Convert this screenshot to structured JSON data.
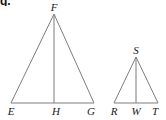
{
  "figure": {
    "corner_tag": "g.",
    "background_color": "#ffffff",
    "stroke_color": "#7d7d7d",
    "label_color": "#1b1b1b",
    "stroke_width": 1,
    "width": 166,
    "height": 120,
    "triangles": [
      {
        "name": "triangle-efg",
        "vertices": {
          "apex": {
            "label": "F",
            "x": 54,
            "y": 14
          },
          "base_left": {
            "label": "E",
            "x": 11,
            "y": 103
          },
          "base_right": {
            "label": "G",
            "x": 94,
            "y": 103
          }
        },
        "altitude_foot": {
          "label": "H",
          "x": 54,
          "y": 103
        },
        "label_positions": {
          "F": {
            "x": 54,
            "y": 2
          },
          "E": {
            "x": 11,
            "y": 106
          },
          "H": {
            "x": 56,
            "y": 106
          },
          "G": {
            "x": 91,
            "y": 106
          }
        }
      },
      {
        "name": "triangle-rst",
        "vertices": {
          "apex": {
            "label": "S",
            "x": 136,
            "y": 57
          },
          "base_left": {
            "label": "R",
            "x": 114,
            "y": 103
          },
          "base_right": {
            "label": "T",
            "x": 158,
            "y": 103
          }
        },
        "altitude_foot": {
          "label": "W",
          "x": 136,
          "y": 103
        },
        "label_positions": {
          "S": {
            "x": 136,
            "y": 45
          },
          "R": {
            "x": 114,
            "y": 106
          },
          "W": {
            "x": 136,
            "y": 106
          },
          "T": {
            "x": 155,
            "y": 106
          }
        }
      }
    ],
    "labels": [
      {
        "id": "label-F",
        "text": "F",
        "x": 54,
        "y": 2
      },
      {
        "id": "label-E",
        "text": "E",
        "x": 11,
        "y": 106
      },
      {
        "id": "label-H",
        "text": "H",
        "x": 56,
        "y": 106
      },
      {
        "id": "label-G",
        "text": "G",
        "x": 91,
        "y": 106
      },
      {
        "id": "label-S",
        "text": "S",
        "x": 136,
        "y": 45
      },
      {
        "id": "label-R",
        "text": "R",
        "x": 114,
        "y": 106
      },
      {
        "id": "label-W",
        "text": "W",
        "x": 136,
        "y": 106
      },
      {
        "id": "label-T",
        "text": "T",
        "x": 155,
        "y": 106
      }
    ]
  }
}
